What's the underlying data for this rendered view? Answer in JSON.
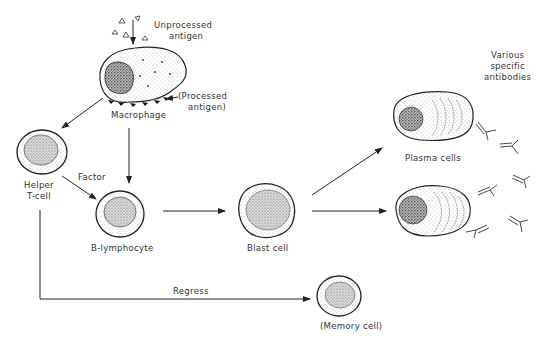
{
  "diagram": {
    "type": "immune-response-flow",
    "nodes": {
      "macrophage": {
        "label": "Macrophage"
      },
      "helper_tcell": {
        "label_line1": "Helper",
        "label_line2": "T-cell"
      },
      "b_lymphocyte": {
        "label": "B-lymphocyte"
      },
      "blast_cell": {
        "label": "Blast cell"
      },
      "plasma_cells": {
        "label": "Plasma cells"
      },
      "memory_cell": {
        "label": "(Memory cell)"
      }
    },
    "annotations": {
      "unprocessed_antigen_line1": "Unprocessed",
      "unprocessed_antigen_line2": "antigen",
      "processed_antigen_line1": "(Processed",
      "processed_antigen_line2": "antigen)",
      "antibodies_line1": "Various",
      "antibodies_line2": "specific",
      "antibodies_line3": "antibodies"
    },
    "edges": {
      "factor": "Factor",
      "regress": "Regress"
    },
    "colors": {
      "ink": "#222222",
      "stipple": "#555555",
      "background": "#ffffff"
    }
  }
}
